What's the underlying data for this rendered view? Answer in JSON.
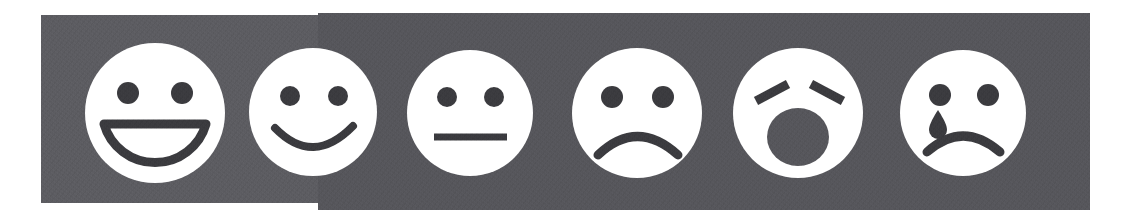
{
  "figure": {
    "name": "smiley-face-rating-scale",
    "background_color": "#ffffff",
    "band_color": "#55555a",
    "band_color_left_segment": "#5b5b60",
    "face_color": "#ffffff",
    "feature_color": "#3a3a3e",
    "face_count": 6
  },
  "faces": [
    {
      "index": 1,
      "name": "face-very-happy",
      "expression": "very happy",
      "mouth": "open-grin",
      "eyes": "round-dots",
      "cx": 155,
      "cy": 113,
      "r": 70
    },
    {
      "index": 2,
      "name": "face-happy",
      "expression": "happy",
      "mouth": "smile-arc",
      "eyes": "round-dots",
      "cx": 313,
      "cy": 112,
      "r": 64
    },
    {
      "index": 3,
      "name": "face-neutral",
      "expression": "neutral",
      "mouth": "straight-line",
      "eyes": "round-dots",
      "cx": 470,
      "cy": 113,
      "r": 63
    },
    {
      "index": 4,
      "name": "face-sad",
      "expression": "sad",
      "mouth": "frown-arc",
      "eyes": "round-dots",
      "cx": 637,
      "cy": 113,
      "r": 65
    },
    {
      "index": 5,
      "name": "face-distressed",
      "expression": "distressed",
      "mouth": "open-round",
      "eyes": "angled-bars",
      "cx": 798,
      "cy": 113,
      "r": 65
    },
    {
      "index": 6,
      "name": "face-crying",
      "expression": "crying",
      "mouth": "frown-arc",
      "eyes": "round-dots-with-tear",
      "cx": 963,
      "cy": 113,
      "r": 63
    }
  ]
}
